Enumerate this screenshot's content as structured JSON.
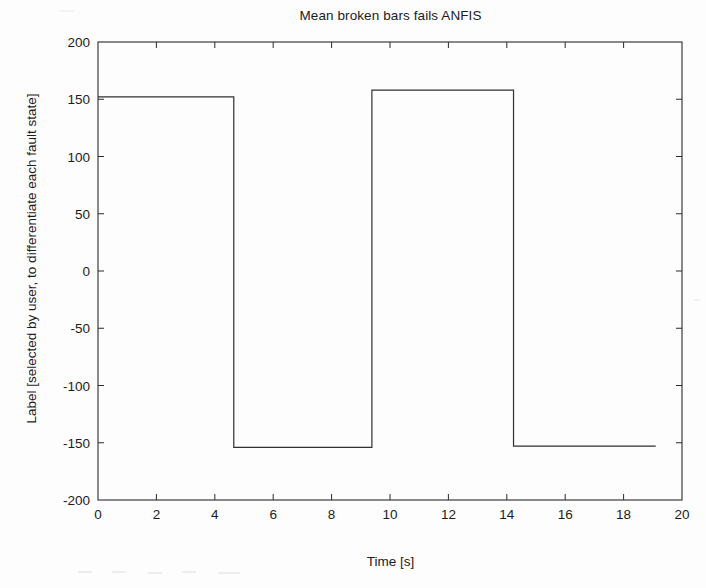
{
  "chart_data": {
    "type": "line",
    "title": "Mean broken bars fails ANFIS",
    "xlabel": "Time [s]",
    "ylabel": "Label [selected by user, to differentiate each fault state]",
    "xlim": [
      0,
      20
    ],
    "ylim": [
      -200,
      200
    ],
    "xticks": [
      0,
      2,
      4,
      6,
      8,
      10,
      12,
      14,
      16,
      18,
      20
    ],
    "yticks": [
      -200,
      -150,
      -100,
      -50,
      0,
      50,
      100,
      150,
      200
    ],
    "xtick_labels": [
      "0",
      "2",
      "4",
      "6",
      "8",
      "10",
      "12",
      "14",
      "16",
      "18",
      "20"
    ],
    "ytick_labels": [
      "-200",
      "-150",
      "-100",
      "-50",
      "0",
      "50",
      "100",
      "150",
      "200"
    ],
    "grid": false,
    "legend": "none",
    "line_color": "#303030",
    "line_width": 1.2,
    "series": [
      {
        "name": "Label",
        "x": [
          0,
          4.65,
          4.65,
          9.38,
          9.38,
          14.23,
          14.23,
          19.1
        ],
        "y": [
          152,
          152,
          -154,
          -154,
          158,
          158,
          -153,
          -153
        ]
      }
    ],
    "annotations": [
      "Square wave: high plateau 152 from t=0 to t=4.65",
      "low plateau -154 from t=4.65 to t=9.38",
      "high plateau 158 from t=9.38 to t=14.23",
      "low plateau -153 from t=14.23 to t=19.1"
    ]
  },
  "axes": {
    "box_on": true,
    "tick_direction": "in"
  }
}
